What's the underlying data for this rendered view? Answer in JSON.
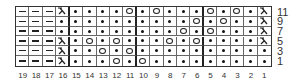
{
  "chart": {
    "type": "knitting-chart",
    "columns": [
      "19",
      "18",
      "17",
      "16",
      "15",
      "14",
      "13",
      "12",
      "11",
      "10",
      "9",
      "8",
      "7",
      "6",
      "5",
      "4",
      "3",
      "2",
      "1"
    ],
    "row_labels": [
      "11",
      "9",
      "7",
      "5",
      "3",
      "1"
    ],
    "legend_symbols": {
      "-": "purl",
      "•": "knit",
      "O": "yarn-over",
      "Λ": "decrease"
    },
    "rows": [
      {
        "label": "11",
        "cells": [
          "-",
          "-",
          "-",
          "Λ",
          "•",
          "•",
          "•",
          "•",
          "O",
          "•",
          "O",
          "•",
          "•",
          "•",
          "O",
          "•",
          "O",
          "•",
          "Λ"
        ]
      },
      {
        "label": "9",
        "cells": [
          "-",
          "-",
          "-",
          "•",
          "•",
          "•",
          "•",
          "•",
          "•",
          "•",
          "•",
          "•",
          "•",
          "O",
          "•",
          "O",
          "•",
          "•",
          "Λ"
        ]
      },
      {
        "label": "7",
        "cells": [
          "-",
          "-",
          "-",
          "•",
          "•",
          "•",
          "•",
          "•",
          "•",
          "•",
          "•",
          "•",
          "O",
          "•",
          "O",
          "•",
          "•",
          "•",
          "Λ"
        ]
      },
      {
        "label": "5",
        "cells": [
          "-",
          "-",
          "-",
          "Λ",
          "•",
          "O",
          "•",
          "O",
          "•",
          "•",
          "•",
          "O",
          "•",
          "O",
          "•",
          "•",
          "•",
          "•",
          "Λ"
        ]
      },
      {
        "label": "3",
        "cells": [
          "-",
          "-",
          "-",
          "Λ",
          "•",
          "•",
          "O",
          "•",
          "O",
          "•",
          "•",
          "•",
          "•",
          "•",
          "•",
          "•",
          "•",
          "•",
          "•"
        ]
      },
      {
        "label": "1",
        "cells": [
          "-",
          "-",
          "-",
          "Λ",
          "•",
          "•",
          "•",
          "O",
          "•",
          "O",
          "•",
          "•",
          "•",
          "•",
          "•",
          "•",
          "•",
          "•",
          "•"
        ]
      }
    ],
    "thick_divider_after_columns": [
      "16",
      "11",
      "6"
    ]
  }
}
